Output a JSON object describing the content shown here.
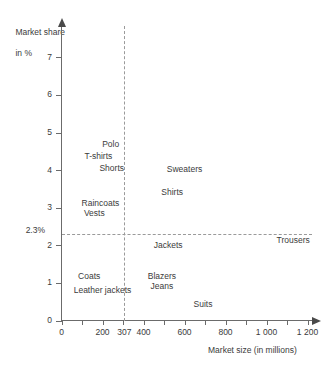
{
  "chart_data": {
    "type": "scatter",
    "title": "",
    "xlabel": "Market size (in millions)",
    "ylabel": "Market share\nin %",
    "ylabel_line1": "Market share",
    "ylabel_line2": "in %",
    "xlim": [
      0,
      1250
    ],
    "ylim": [
      0,
      7.4
    ],
    "grid": false,
    "legend": "none",
    "xticks": [
      0,
      200,
      307,
      400,
      600,
      800,
      1000,
      1200
    ],
    "xticklabels": [
      "0",
      "200",
      "307",
      "400",
      "600",
      "800",
      "1 000",
      "1 200"
    ],
    "yticks": [
      0,
      1,
      2,
      3,
      4,
      5,
      6,
      7
    ],
    "yticklabels": [
      "0",
      "1",
      "2",
      "3",
      "4",
      "5",
      "6",
      "7"
    ],
    "reference_lines": [
      {
        "name": "vertical-307",
        "axis": "x",
        "value": 307,
        "label": "307",
        "style": "dashed"
      },
      {
        "name": "horizontal-2.3",
        "axis": "y",
        "value": 2.3,
        "label": "2.3%",
        "style": "dashed"
      }
    ],
    "points": [
      {
        "label": "Polo",
        "x": 240,
        "y": 4.7
      },
      {
        "label": "T-shirts",
        "x": 180,
        "y": 4.38
      },
      {
        "label": "Shorts",
        "x": 245,
        "y": 4.05
      },
      {
        "label": "Sweaters",
        "x": 600,
        "y": 4.02
      },
      {
        "label": "Shirts",
        "x": 540,
        "y": 3.43
      },
      {
        "label": "Raincoats",
        "x": 190,
        "y": 3.13
      },
      {
        "label": "Vests",
        "x": 160,
        "y": 2.85
      },
      {
        "label": "Trousers",
        "x": 1130,
        "y": 2.14
      },
      {
        "label": "Jackets",
        "x": 520,
        "y": 2.0
      },
      {
        "label": "Coats",
        "x": 135,
        "y": 1.18
      },
      {
        "label": "Blazers",
        "x": 490,
        "y": 1.18
      },
      {
        "label": "Jeans",
        "x": 490,
        "y": 0.92
      },
      {
        "label": "Leather jackets",
        "x": 200,
        "y": 0.82
      },
      {
        "label": "Suits",
        "x": 690,
        "y": 0.45
      }
    ]
  },
  "colors": {
    "axis": "#6b6b6b",
    "text": "#3b3b3b",
    "reference": "#9a9a9a",
    "background": "#ffffff"
  }
}
